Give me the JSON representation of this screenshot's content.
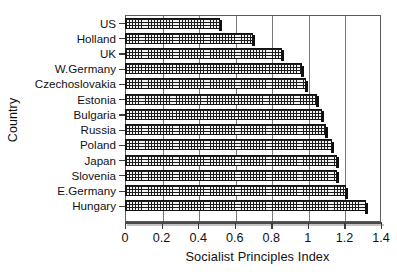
{
  "chart_data": {
    "type": "bar",
    "orientation": "horizontal",
    "title": "",
    "xlabel": "Socialist Principles Index",
    "ylabel": "Country",
    "categories": [
      "US",
      "Holland",
      "UK",
      "W.Germany",
      "Czechoslovakia",
      "Estonia",
      "Bulgaria",
      "Russia",
      "Poland",
      "Japan",
      "Slovenia",
      "E.Germany",
      "Hungary"
    ],
    "values": [
      0.52,
      0.7,
      0.86,
      0.97,
      0.99,
      1.05,
      1.08,
      1.1,
      1.13,
      1.16,
      1.16,
      1.21,
      1.32
    ],
    "xlim": [
      0,
      1.4
    ],
    "xticks": [
      0,
      0.2,
      0.4,
      0.6,
      0.8,
      1,
      1.2,
      1.4
    ],
    "xtick_labels": [
      "0",
      "0.2",
      "0.4",
      "0.6",
      "0.8",
      "1",
      "1.2",
      "1.4"
    ],
    "grid": "vertical",
    "legend": "none",
    "bar_fill": "cross-hatch-grid",
    "bar_edge_color": "#121212",
    "bar_face_color": "#f2f2f2",
    "axis_color": "#5b5b5b"
  }
}
